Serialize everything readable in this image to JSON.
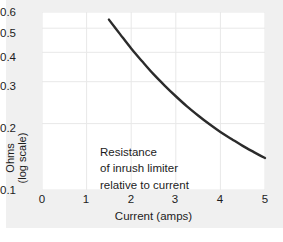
{
  "chart_data": {
    "type": "line",
    "title": "",
    "subtitle": "",
    "xlabel": "Current (amps)",
    "ylabel_line1": "Ohms",
    "ylabel_line2": "(log scale)",
    "xlim": [
      0,
      5
    ],
    "ylim": [
      0.1,
      0.65
    ],
    "yscale": "log",
    "xscale": "linear",
    "grid": true,
    "legend": "none",
    "xticks": [
      0,
      1,
      2,
      3,
      4,
      5
    ],
    "xtick_labels": [
      "0",
      "1",
      "2",
      "3",
      "4",
      "5"
    ],
    "yticks": [
      0.1,
      0.2,
      0.3,
      0.4,
      0.5,
      0.6
    ],
    "ytick_labels": [
      "0.1",
      "0.2",
      "0.3",
      "0.4",
      "0.5",
      "0.6"
    ],
    "series": [
      {
        "name": "Resistance of inrush limiter",
        "color": "#2b2b2b",
        "linewidth": 2.4,
        "x": [
          1.5,
          1.75,
          2.0,
          2.25,
          2.5,
          2.75,
          3.0,
          3.25,
          3.5,
          3.75,
          4.0,
          4.25,
          4.5,
          4.75,
          5.0
        ],
        "y": [
          0.6,
          0.515,
          0.443,
          0.386,
          0.338,
          0.3,
          0.268,
          0.241,
          0.219,
          0.2,
          0.184,
          0.171,
          0.159,
          0.149,
          0.14
        ]
      }
    ],
    "annotations": [
      {
        "line1": "Resistance",
        "line2": "of inrush limiter",
        "line3": "relative to current",
        "x": 0.35,
        "y": 0.19
      }
    ]
  },
  "figure": {
    "background_color": "#ffffff",
    "panel_color": "#f0f0f0",
    "plot_background": "#ffffff",
    "grid_color": "#e8e8e8",
    "text_color": "#1c1c1c"
  }
}
